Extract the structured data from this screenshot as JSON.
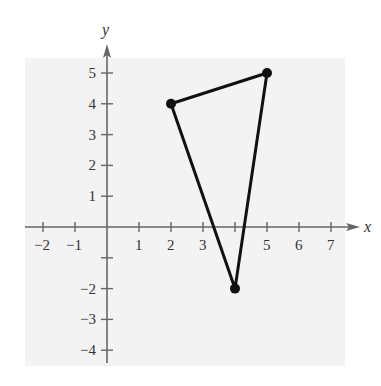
{
  "chart_data": {
    "type": "scatter",
    "subtype": "polygon",
    "title": "",
    "xlabel": "x",
    "ylabel": "y",
    "xlim": [
      -2,
      7
    ],
    "ylim": [
      -4,
      5
    ],
    "grid": false,
    "legend": null,
    "x_ticks": [
      -2,
      -1,
      1,
      2,
      3,
      4,
      5,
      6,
      7
    ],
    "x_tick_labels": [
      "−2",
      "−1",
      "1",
      "2",
      "3",
      "",
      "5",
      "6",
      "7"
    ],
    "y_ticks": [
      -4,
      -3,
      -2,
      -1,
      1,
      2,
      3,
      4,
      5
    ],
    "y_tick_labels": [
      "−4",
      "−3",
      "−2",
      "",
      "1",
      "2",
      "3",
      "4",
      "5"
    ],
    "series": [
      {
        "name": "triangle",
        "closed": true,
        "points": [
          {
            "x": 2,
            "y": 4
          },
          {
            "x": 5,
            "y": 5
          },
          {
            "x": 4,
            "y": -2
          }
        ]
      }
    ]
  },
  "labels": {
    "x_axis": "x",
    "y_axis": "y"
  },
  "colors": {
    "panel": "#f3f3f3",
    "axis": "#666666",
    "polygon": "#111111"
  }
}
